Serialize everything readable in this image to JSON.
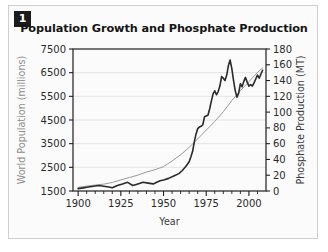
{
  "figure": {
    "number_badge": "1"
  },
  "chart_data": {
    "type": "line",
    "title": "Population Growth and Phosphate Production",
    "xlabel": "Year",
    "ylabel": "World Population (millions)",
    "y2label": "Phosphate Production (MT)",
    "xlim": [
      1897,
      2010
    ],
    "ylim": [
      1500,
      7500
    ],
    "y2lim": [
      0,
      180
    ],
    "grid": true,
    "legend": "none",
    "xticks": [
      1900,
      1925,
      1950,
      1975,
      2000
    ],
    "xtick_labels": [
      "1900",
      "1925",
      "1950",
      "1975",
      "2000"
    ],
    "xminor_step": 5,
    "yticks": [
      1500,
      2500,
      3500,
      4500,
      5500,
      6500,
      7500
    ],
    "ytick_labels": [
      "1500",
      "2500",
      "3500",
      "4500",
      "5500",
      "6500",
      "7500"
    ],
    "y2ticks": [
      0,
      20,
      40,
      60,
      80,
      100,
      120,
      140,
      160,
      180
    ],
    "y2tick_labels": [
      "0",
      "20",
      "40",
      "60",
      "80",
      "100",
      "120",
      "140",
      "160",
      "180"
    ],
    "series": [
      {
        "name": "World Population (millions)",
        "axis": "left",
        "color": "#9a9a9a",
        "width": 1.0,
        "x": [
          1900,
          1905,
          1910,
          1915,
          1920,
          1925,
          1930,
          1935,
          1940,
          1945,
          1950,
          1955,
          1960,
          1965,
          1970,
          1975,
          1980,
          1985,
          1990,
          1995,
          2000,
          2005,
          2008
        ],
        "values": [
          1650,
          1710,
          1750,
          1790,
          1860,
          1970,
          2070,
          2170,
          2300,
          2400,
          2530,
          2770,
          3030,
          3340,
          3700,
          4070,
          4440,
          4850,
          5320,
          5740,
          6120,
          6510,
          6700
        ]
      },
      {
        "name": "Phosphate Production (MT)",
        "axis": "right",
        "color": "#2a2a2a",
        "width": 1.6,
        "x": [
          1900,
          1903,
          1906,
          1909,
          1912,
          1915,
          1918,
          1920,
          1923,
          1926,
          1929,
          1932,
          1935,
          1938,
          1941,
          1944,
          1946,
          1948,
          1950,
          1953,
          1956,
          1959,
          1961,
          1963,
          1964,
          1965,
          1966,
          1967,
          1968,
          1969,
          1970,
          1971,
          1972,
          1973,
          1974,
          1975,
          1976,
          1977,
          1978,
          1979,
          1980,
          1981,
          1982,
          1983,
          1984,
          1985,
          1986,
          1987,
          1988,
          1989,
          1990,
          1991,
          1992,
          1993,
          1994,
          1995,
          1996,
          1997,
          1998,
          1999,
          2000,
          2001,
          2002,
          2003,
          2004,
          2005,
          2006,
          2007,
          2008
        ],
        "values": [
          3,
          4,
          5,
          6,
          7,
          6,
          5,
          4,
          7,
          9,
          11,
          7,
          9,
          11,
          10,
          9,
          11,
          13,
          14,
          16,
          19,
          22,
          26,
          31,
          34,
          37,
          43,
          50,
          62,
          72,
          79,
          81,
          82,
          84,
          94,
          95,
          96,
          104,
          114,
          123,
          127,
          122,
          126,
          133,
          145,
          143,
          140,
          147,
          159,
          166,
          155,
          140,
          127,
          119,
          124,
          136,
          132,
          139,
          144,
          138,
          133,
          135,
          133,
          137,
          142,
          147,
          143,
          148,
          153
        ]
      }
    ]
  }
}
